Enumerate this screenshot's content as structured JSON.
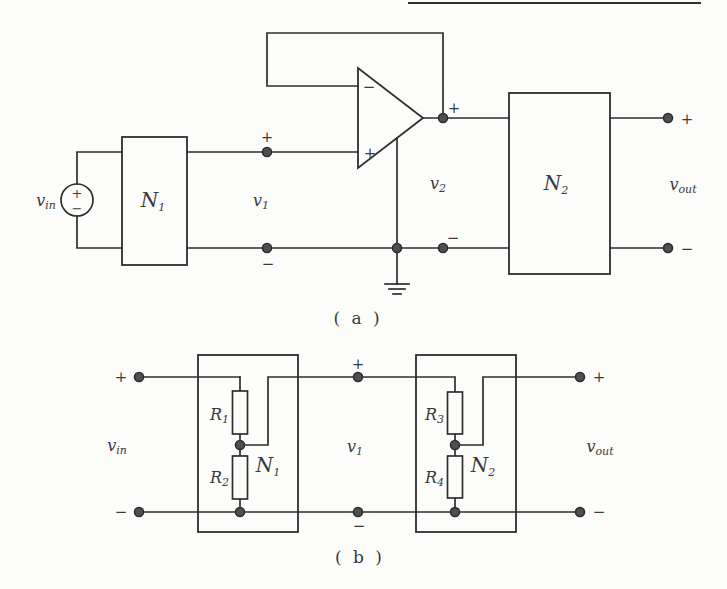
{
  "colors": {
    "paper": "#fcfcfa",
    "ink": "#2e2e2e",
    "label": "#3a3a3a",
    "node_fill": "#4f4f4f"
  },
  "symbols": {
    "plus": "+",
    "minus": "−"
  },
  "circuit_a": {
    "caption": "( a )",
    "vin": {
      "main": "v",
      "sub": "in"
    },
    "n1": {
      "main": "N",
      "sub": "1"
    },
    "v1": {
      "main": "v",
      "sub": "1"
    },
    "v2": {
      "main": "v",
      "sub": "2"
    },
    "n2": {
      "main": "N",
      "sub": "2"
    },
    "vout": {
      "main": "v",
      "sub": "out"
    }
  },
  "circuit_b": {
    "caption": "( b )",
    "vin": {
      "main": "v",
      "sub": "in"
    },
    "r1": {
      "main": "R",
      "sub": "1"
    },
    "r2": {
      "main": "R",
      "sub": "2"
    },
    "n1": {
      "main": "N",
      "sub": "1"
    },
    "v1": {
      "main": "v",
      "sub": "1"
    },
    "r3": {
      "main": "R",
      "sub": "3"
    },
    "r4": {
      "main": "R",
      "sub": "4"
    },
    "n2": {
      "main": "N",
      "sub": "2"
    },
    "vout": {
      "main": "v",
      "sub": "out"
    }
  }
}
